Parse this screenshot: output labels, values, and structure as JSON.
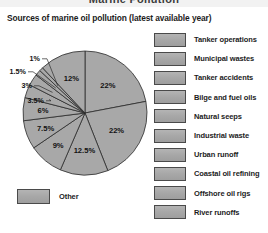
{
  "banner": {
    "title": "Marine Pollution"
  },
  "subtitle": "Sources of marine oil pollution (latest available year)",
  "legend": {
    "items": [
      {
        "label": "Tanker operations"
      },
      {
        "label": "Municipal wastes"
      },
      {
        "label": "Tanker accidents"
      },
      {
        "label": "Bilge and fuel oils"
      },
      {
        "label": "Natural seeps"
      },
      {
        "label": "Industrial waste"
      },
      {
        "label": "Urban runoff"
      },
      {
        "label": "Coastal oil refining"
      },
      {
        "label": "Offshore oil rigs"
      },
      {
        "label": "River runoffs"
      }
    ]
  },
  "other_key": {
    "label": "Other"
  },
  "colors": {
    "slice_fill": "#a8a8a8",
    "slice_stroke": "#2b2b2b",
    "swatch_fill": "#a7a7a7",
    "swatch_stroke": "#4a4a4a",
    "text": "#1c1c1c",
    "banner_bg": "#f2f2f2"
  },
  "chart_data": {
    "type": "pie",
    "title": "Sources of marine oil pollution (latest available year)",
    "unit": "%",
    "legend_position": "right",
    "categories": [
      "Tanker operations",
      "Municipal wastes",
      "Tanker accidents",
      "Bilge and fuel oils",
      "Natural seeps",
      "Industrial waste",
      "Urban runoff",
      "Coastal oil refining",
      "Offshore oil rigs",
      "River runoffs",
      "Other"
    ],
    "values": [
      22,
      22,
      12.5,
      9,
      7.5,
      6,
      3.5,
      3,
      1.5,
      1,
      12
    ],
    "labels": [
      "22%",
      "22%",
      "12.5%",
      "9%",
      "7.5%",
      "6%",
      "3.5%",
      "3%",
      "1.5%",
      "1%",
      "12%"
    ],
    "total": 100
  }
}
